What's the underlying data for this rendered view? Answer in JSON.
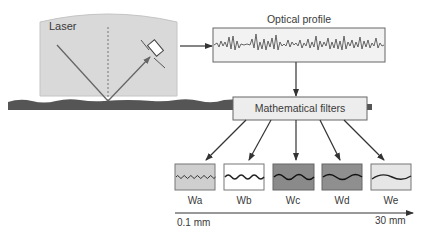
{
  "laser": {
    "label": "Laser",
    "housing_color": "#d9d9d9"
  },
  "optical_profile": {
    "label": "Optical profile",
    "box_color": "#f2f2f2"
  },
  "filters": {
    "label": "Mathematical filters",
    "box_color": "#ededed"
  },
  "surface": {
    "color": "#555555"
  },
  "waviness": [
    {
      "label": "Wa",
      "fill": "#cfcfcf",
      "wave_amplitude": 2,
      "wave_count": 11
    },
    {
      "label": "Wb",
      "fill": "#ffffff",
      "wave_amplitude": 2.5,
      "wave_count": 6
    },
    {
      "label": "Wc",
      "fill": "#8a8a8a",
      "wave_amplitude": 3,
      "wave_count": 4
    },
    {
      "label": "Wd",
      "fill": "#8f8f8f",
      "wave_amplitude": 3,
      "wave_count": 3
    },
    {
      "label": "We",
      "fill": "#e6e6e6",
      "wave_amplitude": 3,
      "wave_count": 1.5
    }
  ],
  "scale_axis": {
    "min_label": "0.1 mm",
    "max_label": "30 mm"
  }
}
